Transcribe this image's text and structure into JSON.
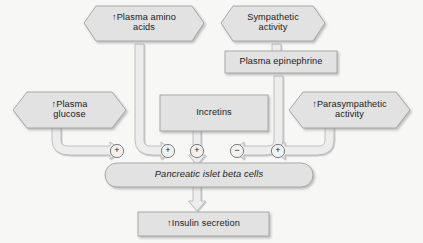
{
  "diagram": {
    "colors": {
      "node_fill": "#e2e2e2",
      "node_stroke": "#9a9a9a",
      "pipe_fill": "#ededed",
      "pipe_stroke": "#b4b4b4",
      "text": "#1a1a1a",
      "background": "#f7f7f5"
    },
    "nodes": {
      "plasma_amino_acids": {
        "label": "↑Plasma amino\nacids",
        "shape": "hexagon"
      },
      "sympathetic_activity": {
        "label": "Sympathetic\nactivity",
        "shape": "hexagon"
      },
      "plasma_epinephrine": {
        "label": "Plasma epinephrine",
        "shape": "rectangle"
      },
      "plasma_glucose": {
        "label": "↑Plasma\nglucose",
        "shape": "hexagon"
      },
      "incretins": {
        "label": "Incretins",
        "shape": "rectangle"
      },
      "parasympathetic_activity": {
        "label": "↑Parasympathetic\nactivity",
        "shape": "hexagon"
      },
      "beta_cells": {
        "label": "Pancreatic islet beta cells",
        "shape": "capsule"
      },
      "insulin_secretion": {
        "label": "↑Insulin secretion",
        "shape": "rectangle"
      }
    },
    "signs": [
      {
        "id": "sign-glucose",
        "symbol": "+",
        "source": "plasma_glucose"
      },
      {
        "id": "sign-amino-acids",
        "symbol": "+",
        "source": "plasma_amino_acids"
      },
      {
        "id": "sign-incretins",
        "symbol": "+",
        "source": "incretins"
      },
      {
        "id": "sign-epinephrine",
        "symbol": "−",
        "source": "plasma_epinephrine"
      },
      {
        "id": "sign-parasympathetic",
        "symbol": "+",
        "source": "parasympathetic_activity"
      }
    ]
  }
}
